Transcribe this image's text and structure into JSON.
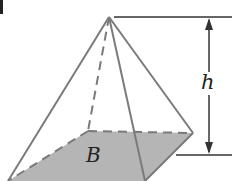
{
  "figure": {
    "type": "square pyramid",
    "labels": {
      "height": "h",
      "base": "B"
    },
    "colors": {
      "edge": "#7a7a7a",
      "base_fill": "#b5b5b5",
      "dimension_line": "#333333",
      "text": "#222222"
    },
    "vertices": {
      "apex": [
        109,
        17
      ],
      "back_left": [
        88,
        131
      ],
      "back_right": [
        193,
        133
      ],
      "front_left": [
        8,
        181
      ],
      "front_right": [
        145,
        181
      ]
    },
    "height_indicator": {
      "x": 209,
      "top_y": 17,
      "bottom_y": 155
    }
  }
}
